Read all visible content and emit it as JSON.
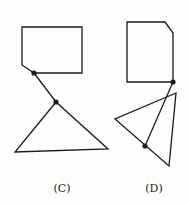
{
  "colors": {
    "stroke": "#1a1a1a",
    "background": "#fdfdfb"
  },
  "figures": [
    {
      "label": "(C)",
      "label_pos": [
        62,
        182
      ],
      "rectangle": "22,27 82,27 82,73 34,73 22,65",
      "connector": [
        34,
        73,
        56,
        102
      ],
      "triangle": "56,102 15,152 108,149",
      "dots": [
        [
          34,
          73
        ],
        [
          56,
          102
        ]
      ]
    },
    {
      "label": "(D)",
      "label_pos": [
        154,
        182
      ],
      "rectangle": "127,22 165,22 173,33 173,82 127,82",
      "connector": [
        173,
        82,
        145,
        146
      ],
      "triangle": "176,93 115,119 169,166",
      "dots": [
        [
          173,
          82
        ],
        [
          145,
          146
        ]
      ]
    }
  ]
}
